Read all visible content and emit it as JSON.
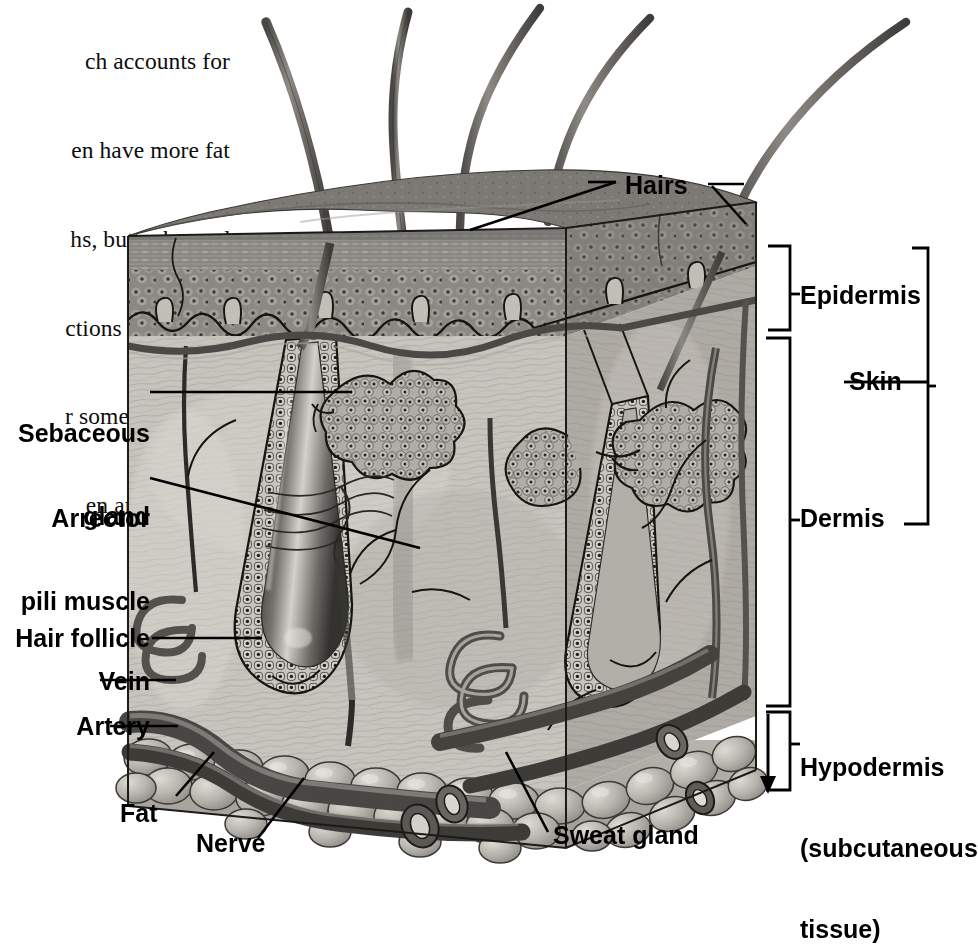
{
  "page": {
    "kind": "anatomy-illustration",
    "background_color": "#ffffff",
    "ink_color": "#000000"
  },
  "body_text": {
    "lines": [
      "ch accounts for",
      "en have more fat",
      "hs, buttocks, and",
      "ctions as padding",
      "r some of the dif-",
      "en and women."
    ],
    "clipped_left": true
  },
  "labels": {
    "hairs": "Hairs",
    "epidermis": "Epidermis",
    "skin": "Skin",
    "dermis": "Dermis",
    "hypodermis_line1": "Hypodermis",
    "hypodermis_line2": "(subcutaneous",
    "hypodermis_line3": "tissue)",
    "sebaceous_line1": "Sebaceous",
    "sebaceous_line2": "gland",
    "arrector_line1": "Arrector",
    "arrector_line2": "pili muscle",
    "hair_follicle": "Hair follicle",
    "vein": "Vein",
    "artery": "Artery",
    "fat": "Fat",
    "nerve": "Nerve",
    "sweat_gland": "Sweat gland"
  },
  "layers": [
    {
      "name": "Epidermis",
      "bracket_top": 245,
      "bracket_bottom": 330
    },
    {
      "name": "Dermis",
      "bracket_top": 336,
      "bracket_bottom": 706
    },
    {
      "name": "Hypodermis (subcutaneous tissue)",
      "bracket_top": 712,
      "bracket_bottom": 790
    },
    {
      "name": "Skin",
      "bracket_top": 245,
      "bracket_bottom": 706
    }
  ],
  "structures": [
    "hair shaft",
    "sebaceous gland",
    "arrector pili muscle",
    "hair follicle",
    "vein",
    "artery",
    "fat lobule",
    "nerve",
    "sweat gland"
  ],
  "palette": {
    "epidermis_fill": "#8c8c8c",
    "dermis_fill": "#c9c6c0",
    "hypodermis_fill": "#b6b2ac",
    "hair_fill": "#6f6f6f",
    "vessel_fill": "#5d5a57",
    "fat_fill": "#b9b5ae",
    "outline": "#111111"
  }
}
